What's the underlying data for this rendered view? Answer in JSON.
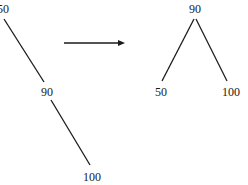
{
  "diagram": {
    "type": "tree-rotation",
    "line_color": "#1a1a1a",
    "before": {
      "nodes": [
        {
          "id": "n50",
          "label": "50"
        },
        {
          "id": "n90",
          "label": "90"
        },
        {
          "id": "n100",
          "label": "100"
        }
      ],
      "edges": [
        [
          "n50",
          "n90"
        ],
        [
          "n90",
          "n100"
        ]
      ]
    },
    "after": {
      "nodes": [
        {
          "id": "m90",
          "label": "90"
        },
        {
          "id": "m50",
          "label": "50"
        },
        {
          "id": "m100",
          "label": "100"
        }
      ],
      "edges": [
        [
          "m90",
          "m50"
        ],
        [
          "m90",
          "m100"
        ]
      ]
    },
    "arrow": {
      "direction": "right"
    }
  }
}
